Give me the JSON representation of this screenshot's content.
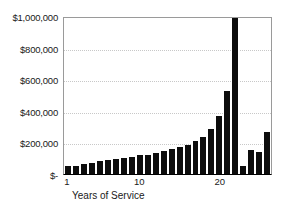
{
  "chart_data": {
    "type": "bar",
    "title": "",
    "xlabel": "Years of Service",
    "ylabel": "",
    "ylim": [
      0,
      1000000
    ],
    "grid": true,
    "legend": null,
    "categories": [
      "1",
      "2",
      "3",
      "4",
      "5",
      "6",
      "7",
      "8",
      "9",
      "10",
      "11",
      "12",
      "13",
      "14",
      "15",
      "16",
      "17",
      "18",
      "19",
      "20",
      "21",
      "22",
      "23",
      "24",
      "25",
      "26"
    ],
    "values": [
      48000,
      50000,
      62000,
      72000,
      82000,
      88000,
      95000,
      100000,
      110000,
      118000,
      122000,
      135000,
      148000,
      158000,
      172000,
      185000,
      208000,
      232000,
      288000,
      368000,
      528000,
      985000,
      48000,
      150000,
      140000,
      265000
    ],
    "xtick_labels": [
      "1",
      "10",
      "20"
    ],
    "xtick_positions": [
      1,
      10,
      20
    ],
    "ytick_labels": [
      "$1,000,000",
      "$800,000",
      "$600,000",
      "$400,000",
      "$200,000",
      "$-"
    ],
    "ytick_values": [
      1000000,
      800000,
      600000,
      400000,
      200000,
      0
    ],
    "bar_color": "#0d0d0d",
    "grid_color": "#c8c8c8",
    "axis_color": "#9a9a9a",
    "background": "#ffffff"
  }
}
